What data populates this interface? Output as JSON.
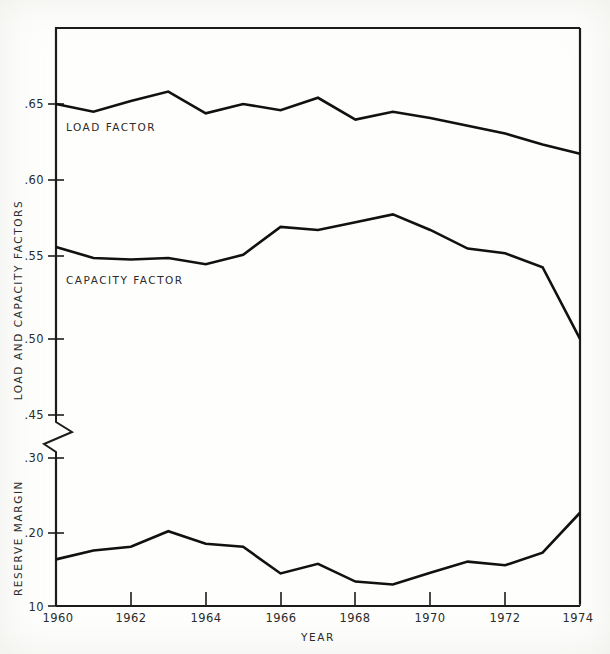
{
  "chart_data": {
    "type": "line",
    "title": "",
    "xlabel": "YEAR",
    "ylabel_upper": "LOAD AND CAPACITY FACTORS",
    "ylabel_lower": "RESERVE MARGIN",
    "x": [
      1960,
      1961,
      1962,
      1963,
      1964,
      1965,
      1966,
      1967,
      1968,
      1969,
      1970,
      1971,
      1972,
      1973,
      1974
    ],
    "xlim": [
      1960,
      1974
    ],
    "xticks": [
      1960,
      1962,
      1964,
      1966,
      1968,
      1970,
      1972,
      1974
    ],
    "xticklabels": [
      "1960",
      "1962",
      "1964",
      "1966",
      "1968",
      "1970",
      "1972",
      "1974"
    ],
    "upper_axis": {
      "ylim": [
        0.45,
        0.665
      ],
      "yticks": [
        0.45,
        0.5,
        0.55,
        0.6,
        0.65
      ],
      "yticklabels": [
        ".45",
        ".50",
        ".55",
        ".60",
        ".65"
      ]
    },
    "lower_axis": {
      "ylim": [
        0.1,
        0.33
      ],
      "yticks": [
        0.1,
        0.2,
        0.3
      ],
      "yticklabels": [
        "10",
        ".20",
        ".30"
      ]
    },
    "axis_break": true,
    "grid": false,
    "legend": "inline-labels",
    "series": [
      {
        "name": "LOAD FACTOR",
        "axis": "upper",
        "values": [
          0.65,
          0.645,
          0.652,
          0.658,
          0.644,
          0.65,
          0.646,
          0.654,
          0.64,
          0.645,
          0.641,
          0.636,
          0.631,
          0.624,
          0.618
        ]
      },
      {
        "name": "CAPACITY FACTOR",
        "axis": "upper",
        "values": [
          0.558,
          0.551,
          0.55,
          0.551,
          0.547,
          0.553,
          0.571,
          0.569,
          0.574,
          0.579,
          0.569,
          0.557,
          0.554,
          0.545,
          0.499
        ]
      },
      {
        "name": "RESERVE MARGIN",
        "axis": "lower",
        "values": [
          0.163,
          0.175,
          0.18,
          0.201,
          0.184,
          0.18,
          0.144,
          0.157,
          0.133,
          0.129,
          0.145,
          0.16,
          0.155,
          0.172,
          0.226
        ]
      }
    ]
  },
  "labels": {
    "load_factor": "LOAD FACTOR",
    "capacity_factor": "CAPACITY FACTOR",
    "reserve_margin": "RESERVE MARGIN",
    "load_and_capacity_factors": "LOAD AND CAPACITY FACTORS",
    "year": "YEAR"
  },
  "y_ticks_upper": [
    {
      "label": ".65",
      "value": 0.65
    },
    {
      "label": ".60",
      "value": 0.6
    },
    {
      "label": ".55",
      "value": 0.55
    },
    {
      "label": ".50",
      "value": 0.5
    },
    {
      "label": ".45",
      "value": 0.45
    }
  ],
  "y_ticks_lower": [
    {
      "label": ".30",
      "value": 0.3
    },
    {
      "label": ".20",
      "value": 0.2
    },
    {
      "label": "10",
      "value": 0.1
    }
  ],
  "x_ticks": [
    {
      "label": "1960",
      "value": 1960
    },
    {
      "label": "1962",
      "value": 1962
    },
    {
      "label": "1964",
      "value": 1964
    },
    {
      "label": "1966",
      "value": 1966
    },
    {
      "label": "1968",
      "value": 1968
    },
    {
      "label": "1970",
      "value": 1970
    },
    {
      "label": "1972",
      "value": 1972
    },
    {
      "label": "1974",
      "value": 1974
    }
  ],
  "colors": {
    "line": "#111111",
    "axis": "#1c1c1c",
    "text": "#2b2b2b",
    "background": "#fefefd"
  }
}
